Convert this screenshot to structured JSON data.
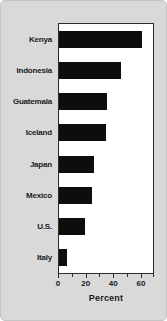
{
  "chart_data": {
    "type": "bar",
    "orientation": "horizontal",
    "title": "",
    "xlabel": "Percent",
    "ylabel": "",
    "xlim": [
      0,
      68
    ],
    "xticks": [
      0,
      20,
      40,
      60
    ],
    "xticklabels": [
      "0",
      "20",
      "40",
      "60"
    ],
    "minor_xticks": [
      10,
      30,
      50
    ],
    "grid": false,
    "legend": null,
    "categories": [
      "Kenya",
      "Indonesia",
      "Guatemala",
      "Iceland",
      "Japan",
      "Mexico",
      "U.S.",
      "Italy"
    ],
    "values": [
      60,
      45,
      35,
      34,
      25,
      24,
      19,
      6
    ],
    "bar_color": "#0d0d0d",
    "plot_background": "#ffffff",
    "figure_background": "#d9d9d9",
    "axis_color": "#2b2b2b"
  }
}
